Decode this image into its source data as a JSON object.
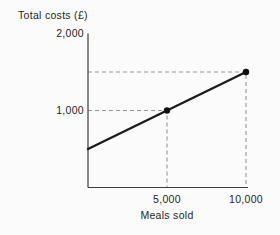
{
  "figure": {
    "background": "#fbfbfb"
  },
  "chart_data": {
    "type": "line",
    "title": "",
    "xlabel": "Meals sold",
    "ylabel": "Total costs (£)",
    "xlim": [
      0,
      10000
    ],
    "ylim": [
      0,
      2000
    ],
    "grid": false,
    "legend": "none",
    "x_ticks": [
      {
        "value": 5000,
        "label": "5,000"
      },
      {
        "value": 10000,
        "label": "10,000"
      }
    ],
    "y_ticks": [
      {
        "value": 1000,
        "label": "1,000"
      },
      {
        "value": 2000,
        "label": "2,000"
      }
    ],
    "series": [
      {
        "name": "total-costs",
        "color": "#1c1c1c",
        "points": [
          {
            "x": 0,
            "y": 500
          },
          {
            "x": 10000,
            "y": 1500
          }
        ],
        "markers": [
          {
            "x": 5000,
            "y": 1000
          },
          {
            "x": 10000,
            "y": 1500
          }
        ]
      }
    ],
    "guide_points": [
      {
        "x": 5000,
        "y": 1000
      },
      {
        "x": 10000,
        "y": 1500
      }
    ],
    "colors": {
      "axis": "#3d3d3d",
      "guide": "#979797",
      "line": "#1c1c1c",
      "marker": "#111111",
      "text": "#1f1f1f"
    }
  }
}
